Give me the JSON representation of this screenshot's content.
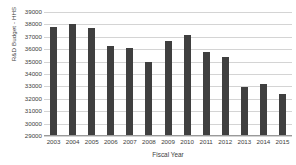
{
  "chart_data": {
    "type": "bar",
    "title": "",
    "xlabel": "Fiscal Year",
    "ylabel": "R&D Budget - HHS",
    "categories": [
      "2003",
      "2004",
      "2005",
      "2006",
      "2007",
      "2008",
      "2009",
      "2010",
      "2011",
      "2012",
      "2013",
      "2014",
      "2015"
    ],
    "values": [
      37780,
      38000,
      37700,
      36280,
      36080,
      34930,
      36650,
      37180,
      35800,
      35350,
      32950,
      33230,
      32350
    ],
    "ylim": [
      29000,
      39000
    ],
    "ytick_labels": [
      "39000",
      "38000",
      "37000",
      "36000",
      "35000",
      "34000",
      "33000",
      "32000",
      "31000",
      "30000",
      "29000"
    ],
    "ytick_values": [
      39000,
      38000,
      37000,
      36000,
      35000,
      34000,
      33000,
      32000,
      31000,
      30000,
      29000
    ],
    "grid": true,
    "legend": "none",
    "bar_color": "#3f3f3f",
    "gridline_color": "#d4d4d4",
    "axis_color": "#9a9a9a",
    "background": "#ffffff"
  }
}
